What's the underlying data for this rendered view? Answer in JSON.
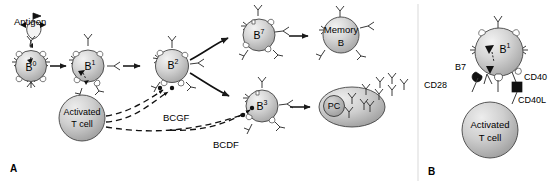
{
  "figure": {
    "title_hidden": "B lymphocyte activation and differentiation",
    "panels": [
      {
        "id": "panel-a",
        "label": "A"
      },
      {
        "id": "panel-b",
        "label": "B"
      }
    ]
  },
  "colors": {
    "cell_fill_light": "#e9e9e9",
    "cell_fill_mid": "#c9c9c9",
    "cell_fill_dark": "#a8a8a8",
    "outline": "#3a3a3a",
    "receptor": "#ffffff",
    "text": "#000000",
    "background": "#ffffff"
  },
  "panel_a": {
    "label": "A",
    "antigen_label": "Antigen",
    "cells": [
      {
        "name": "b0",
        "label": "B",
        "sup": "0"
      },
      {
        "name": "b1",
        "label": "B",
        "sup": "1"
      },
      {
        "name": "b2",
        "label": "B",
        "sup": "2"
      },
      {
        "name": "b7",
        "label": "B",
        "sup": "7"
      },
      {
        "name": "b3",
        "label": "B",
        "sup": "3"
      },
      {
        "name": "memory",
        "label_line1": "Memory",
        "label_line2": "B"
      },
      {
        "name": "plasma",
        "label": "PC"
      },
      {
        "name": "tcell",
        "label_line1": "Activated",
        "label_line2": "T cell"
      }
    ],
    "cytokines": [
      {
        "name": "bcgf",
        "label": "BCGF"
      },
      {
        "name": "bcdf",
        "label": "BCDF"
      }
    ]
  },
  "panel_b": {
    "label": "B",
    "cells": [
      {
        "name": "b1",
        "label": "B",
        "sup": "1"
      },
      {
        "name": "tcell",
        "label_line1": "Activated",
        "label_line2": "T cell"
      }
    ],
    "receptors": [
      {
        "name": "b7",
        "label": "B7"
      },
      {
        "name": "cd28",
        "label": "CD28"
      },
      {
        "name": "cd40",
        "label": "CD40"
      },
      {
        "name": "cd40l",
        "label": "CD40L"
      }
    ]
  }
}
